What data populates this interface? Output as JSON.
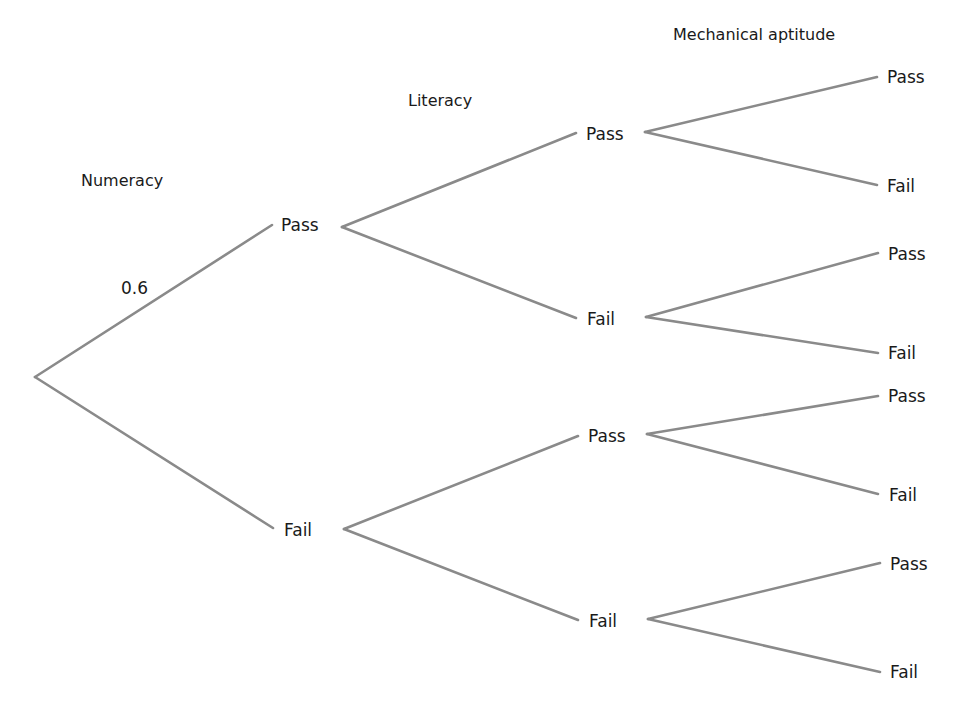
{
  "diagram": {
    "type": "probability-tree",
    "clipped_top_text": "",
    "headers": {
      "numeracy": "Numeracy",
      "literacy": "Literacy",
      "mechanical": "Mechanical aptitude"
    },
    "probabilities": {
      "numeracy_pass": "0.6"
    },
    "level1": [
      {
        "label": "Pass"
      },
      {
        "label": "Fail"
      }
    ],
    "level2": [
      {
        "label": "Pass"
      },
      {
        "label": "Fail"
      },
      {
        "label": "Pass"
      },
      {
        "label": "Fail"
      }
    ],
    "level3": [
      {
        "label": "Pass"
      },
      {
        "label": "Fail"
      },
      {
        "label": "Pass"
      },
      {
        "label": "Fail"
      },
      {
        "label": "Pass"
      },
      {
        "label": "Fail"
      },
      {
        "label": "Pass"
      },
      {
        "label": "Fail"
      }
    ],
    "line_color": "#8a8a8a"
  }
}
